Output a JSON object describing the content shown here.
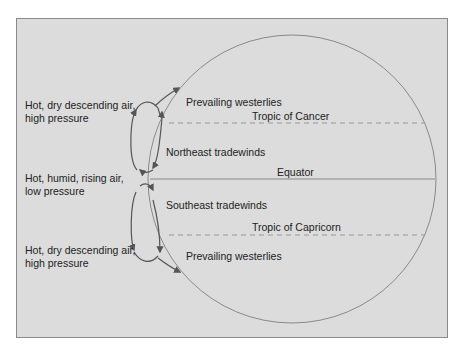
{
  "diagram": {
    "colors": {
      "background": "#dcdcdc",
      "line": "#888888",
      "arrow": "#555555",
      "text": "#222222"
    },
    "left_labels": [
      {
        "line1": "Hot, dry descending air,",
        "line2": "high pressure"
      },
      {
        "line1": "Hot, humid, rising air,",
        "line2": "low pressure"
      },
      {
        "line1": "Hot, dry descending air,",
        "line2": "high pressure"
      }
    ],
    "wind_labels": {
      "north_westerlies": "Prevailing westerlies",
      "northeast_trades": "Northeast tradewinds",
      "southeast_trades": "Southeast tradewinds",
      "south_westerlies": "Prevailing westerlies"
    },
    "latitude_labels": {
      "tropic_cancer": "Tropic of Cancer",
      "equator": "Equator",
      "tropic_capricorn": "Tropic of Capricorn"
    }
  }
}
